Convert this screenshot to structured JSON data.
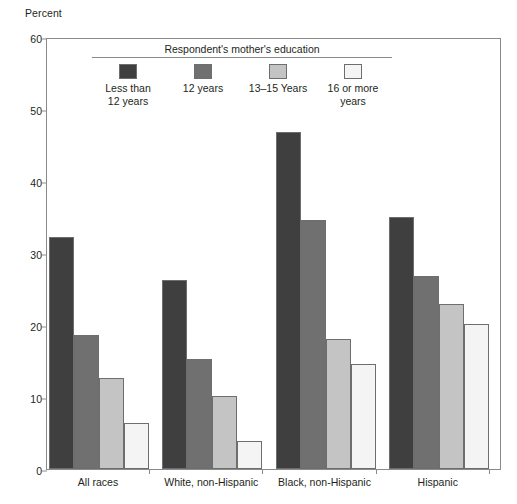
{
  "chart_data": {
    "type": "bar",
    "title": "",
    "subtitle": "",
    "ylabel": "Percent",
    "xlabel": "",
    "ylim": [
      0,
      60
    ],
    "yticks": [
      0,
      10,
      20,
      30,
      40,
      50,
      60
    ],
    "grid": false,
    "legend_position": "top-center-inside",
    "legend_title": "Respondent's mother's education",
    "categories": [
      "All races",
      "White, non-Hispanic",
      "Black, non-Hispanic",
      "Hispanic"
    ],
    "series": [
      {
        "name": "Less than\n12 years",
        "name_flat": "Less than 12 years",
        "color": "#3f3f3f",
        "values": [
          32.2,
          26.2,
          46.8,
          35.0
        ]
      },
      {
        "name": "12 years",
        "name_flat": "12 years",
        "color": "#707070",
        "values": [
          18.6,
          15.3,
          34.6,
          26.8
        ]
      },
      {
        "name": "13–15 Years",
        "name_flat": "13–15 Years",
        "color": "#c4c4c4",
        "values": [
          12.6,
          10.1,
          18.1,
          22.9
        ]
      },
      {
        "name": "16 or more\nyears",
        "name_flat": "16 or more years",
        "color": "#f4f4f4",
        "values": [
          6.4,
          3.9,
          14.6,
          20.1
        ]
      }
    ]
  },
  "axis": {
    "y_title": "Percent",
    "tick_labels": [
      "0",
      "10",
      "20",
      "30",
      "40",
      "50",
      "60"
    ]
  },
  "legend": {
    "title": "Respondent's mother's education",
    "items": [
      {
        "label": "Less than\n12 years",
        "color": "#3f3f3f"
      },
      {
        "label": "12 years",
        "color": "#707070"
      },
      {
        "label": "13–15 Years",
        "color": "#c4c4c4"
      },
      {
        "label": "16 or more\nyears",
        "color": "#f4f4f4"
      }
    ]
  }
}
